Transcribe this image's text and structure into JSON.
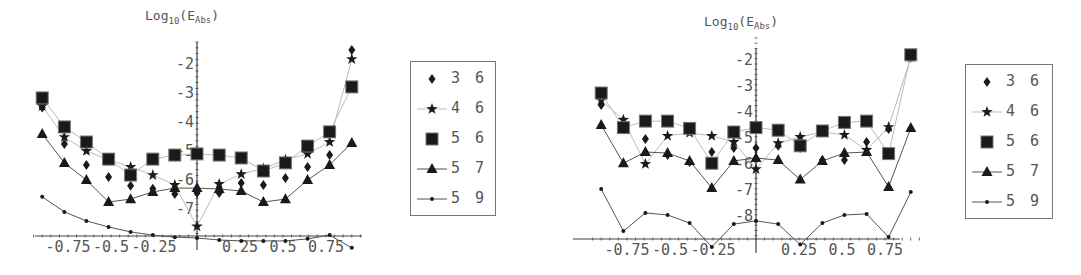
{
  "chart_data": [
    {
      "type": "line",
      "title": "",
      "ylabel": "Log10(E_Abs)",
      "ylabel_main": "Log",
      "ylabel_sub": "10",
      "ylabel_paren": "(E",
      "ylabel_sub2": "Abs",
      "ylabel_close": ")",
      "xlabel": "",
      "xticks": [
        "-0.75",
        "-0.5",
        "-0.25",
        "0.25",
        "0.5",
        "0.75"
      ],
      "xtick_values": [
        -0.75,
        -0.5,
        -0.25,
        0.25,
        0.5,
        0.75
      ],
      "yticks": [
        "-2",
        "-3",
        "-4",
        "-5",
        "-6",
        "-7"
      ],
      "ytick_values": [
        -2,
        -3,
        -4,
        -5,
        -6,
        -7
      ],
      "xlim": [
        -0.95,
        0.95
      ],
      "ylim": [
        -7.9,
        -1.3
      ],
      "x": [
        -0.9,
        -0.771,
        -0.643,
        -0.514,
        -0.386,
        -0.257,
        -0.129,
        0,
        0.129,
        0.257,
        0.386,
        0.514,
        0.643,
        0.771,
        0.9
      ],
      "series": [
        {
          "name": "3 6",
          "marker": "diamond",
          "line": false,
          "values": [
            -3.5,
            -4.76,
            -5.48,
            -5.9,
            -6.2,
            -6.3,
            -6.48,
            -6.45,
            -6.45,
            -6.1,
            -6.17,
            -5.93,
            -5.55,
            -5.14,
            -1.52
          ]
        },
        {
          "name": "4 6",
          "marker": "star",
          "line": true,
          "values": [
            -3.45,
            -4.52,
            -5.0,
            -5.3,
            -5.55,
            -5.83,
            -6.17,
            -7.6,
            -6.14,
            -5.8,
            -5.6,
            -5.3,
            -5.1,
            -4.69,
            -1.83
          ]
        },
        {
          "name": "5 6",
          "marker": "square",
          "line": true,
          "values": [
            -3.17,
            -4.17,
            -4.69,
            -5.28,
            -5.83,
            -5.28,
            -5.14,
            -5.1,
            -5.14,
            -5.24,
            -5.69,
            -5.41,
            -4.83,
            -4.34,
            -2.79
          ]
        },
        {
          "name": "5 7",
          "marker": "triangle",
          "line": true,
          "values": [
            -4.41,
            -5.41,
            -6.0,
            -6.76,
            -6.66,
            -6.41,
            -6.28,
            -6.28,
            -6.31,
            -6.38,
            -6.76,
            -6.66,
            -6.0,
            -5.48,
            -4.72
          ]
        },
        {
          "name": "5 9",
          "marker": "dot",
          "line": true,
          "values": [
            -6.58,
            -7.1,
            -7.41,
            -7.62,
            -7.79,
            -7.9,
            -7.97,
            -8.0,
            -8.07,
            -8.1,
            -8.1,
            -8.1,
            -8.03,
            -7.9,
            -8.34
          ]
        }
      ],
      "legend_position": "right",
      "grid": false
    },
    {
      "type": "line",
      "title": "",
      "ylabel": "Log10(E_Abs)",
      "ylabel_main": "Log",
      "ylabel_sub": "10",
      "ylabel_paren": "(E",
      "ylabel_sub2": "Abs",
      "ylabel_close": ")",
      "xlabel": "",
      "xticks": [
        "-0.75",
        "-0.5",
        "-0.25",
        "0.25",
        "0.5",
        "0.75"
      ],
      "xtick_values": [
        -0.75,
        -0.5,
        -0.25,
        0.25,
        0.5,
        0.75
      ],
      "yticks": [
        "-2",
        "-3",
        "-4",
        "-5",
        "-6",
        "-7",
        "-8"
      ],
      "ytick_values": [
        -2,
        -3,
        -4,
        -5,
        -6,
        -7,
        -8
      ],
      "xlim": [
        -0.95,
        0.95
      ],
      "ylim": [
        -8.9,
        -1.5
      ],
      "x": [
        -0.9,
        -0.771,
        -0.643,
        -0.514,
        -0.386,
        -0.257,
        -0.129,
        0,
        0.129,
        0.257,
        0.386,
        0.514,
        0.643,
        0.771,
        0.9
      ],
      "series": [
        {
          "name": "3 6",
          "marker": "diamond",
          "line": false,
          "values": [
            -3.73,
            -4.57,
            -5.04,
            -5.65,
            -5.92,
            -5.54,
            -5.38,
            -5.38,
            -5.3,
            -5.38,
            -5.85,
            -5.85,
            -5.15,
            -4.65,
            -1.9
          ]
        },
        {
          "name": "4 6",
          "marker": "star",
          "line": true,
          "values": [
            -3.55,
            -4.3,
            -6.0,
            -4.92,
            -4.8,
            -4.92,
            -5.15,
            -6.2,
            -5.2,
            -4.96,
            -4.77,
            -4.88,
            -5.46,
            -4.58,
            -1.9
          ]
        },
        {
          "name": "5 6",
          "marker": "square",
          "line": true,
          "values": [
            -3.27,
            -4.6,
            -4.35,
            -4.35,
            -4.63,
            -5.97,
            -4.77,
            -4.6,
            -4.7,
            -5.3,
            -4.73,
            -4.4,
            -4.35,
            -5.6,
            -1.8
          ]
        },
        {
          "name": "5 7",
          "marker": "triangle",
          "line": true,
          "values": [
            -4.5,
            -5.97,
            -5.54,
            -5.58,
            -5.88,
            -6.92,
            -5.88,
            -5.77,
            -5.85,
            -6.6,
            -5.88,
            -5.58,
            -5.54,
            -6.88,
            -4.62
          ]
        },
        {
          "name": "5 9",
          "marker": "dot",
          "line": true,
          "values": [
            -6.96,
            -8.58,
            -7.88,
            -7.96,
            -8.27,
            -9.19,
            -8.31,
            -8.19,
            -8.31,
            -9.1,
            -8.27,
            -7.96,
            -7.92,
            -8.81,
            -7.08
          ]
        }
      ],
      "legend_position": "right",
      "grid": false
    }
  ],
  "legends": [
    {
      "items": [
        {
          "label": "3 6",
          "marker": "diamond"
        },
        {
          "label": "4 6",
          "marker": "star"
        },
        {
          "label": "5 6",
          "marker": "square"
        },
        {
          "label": "5 7",
          "marker": "triangle"
        },
        {
          "label": "5 9",
          "marker": "dot"
        }
      ]
    },
    {
      "items": [
        {
          "label": "3 6",
          "marker": "diamond"
        },
        {
          "label": "4 6",
          "marker": "star"
        },
        {
          "label": "5 6",
          "marker": "square"
        },
        {
          "label": "5 7",
          "marker": "triangle"
        },
        {
          "label": "5 9",
          "marker": "dot"
        }
      ]
    }
  ],
  "colors": {
    "marker": "#1a1a1a",
    "line_dark": "#555555",
    "line_light": "#bbbbbb",
    "axis": "#444444",
    "text": "#555555"
  }
}
